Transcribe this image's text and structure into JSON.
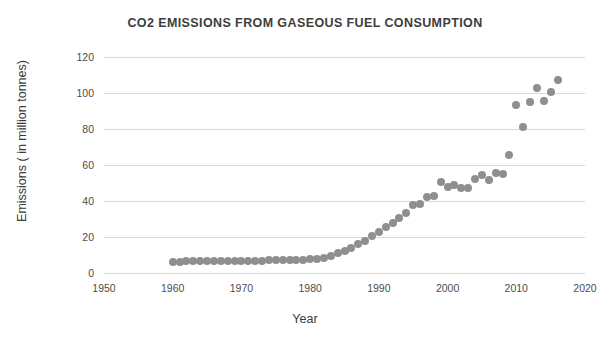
{
  "chart_data": {
    "type": "scatter",
    "title": "CO2 EMISSIONS FROM GASEOUS FUEL CONSUMPTION",
    "xlabel": "Year",
    "ylabel": "Emissions ( in million tonnes)",
    "xlim": [
      1950,
      2020
    ],
    "ylim": [
      0,
      120
    ],
    "xticks": [
      1950,
      1960,
      1970,
      1980,
      1990,
      2000,
      2010,
      2020
    ],
    "yticks": [
      0,
      20,
      40,
      60,
      80,
      100,
      120
    ],
    "grid": "horizontal",
    "legend": "none",
    "marker_color": "#8f8f8f",
    "marker_size": 8,
    "series": [
      {
        "name": "CO2 emissions from gaseous fuel consumption",
        "points": [
          {
            "x": 1960,
            "y": 6.2
          },
          {
            "x": 1961,
            "y": 6.3
          },
          {
            "x": 1962,
            "y": 6.4
          },
          {
            "x": 1963,
            "y": 6.4
          },
          {
            "x": 1964,
            "y": 6.5
          },
          {
            "x": 1965,
            "y": 6.5
          },
          {
            "x": 1966,
            "y": 6.6
          },
          {
            "x": 1967,
            "y": 6.6
          },
          {
            "x": 1968,
            "y": 6.7
          },
          {
            "x": 1969,
            "y": 6.7
          },
          {
            "x": 1970,
            "y": 6.8
          },
          {
            "x": 1971,
            "y": 6.8
          },
          {
            "x": 1972,
            "y": 6.9
          },
          {
            "x": 1973,
            "y": 6.9
          },
          {
            "x": 1974,
            "y": 7.0
          },
          {
            "x": 1975,
            "y": 7.0
          },
          {
            "x": 1976,
            "y": 7.1
          },
          {
            "x": 1977,
            "y": 7.2
          },
          {
            "x": 1978,
            "y": 7.3
          },
          {
            "x": 1979,
            "y": 7.4
          },
          {
            "x": 1980,
            "y": 7.6
          },
          {
            "x": 1981,
            "y": 7.9
          },
          {
            "x": 1982,
            "y": 8.4
          },
          {
            "x": 1983,
            "y": 9.5
          },
          {
            "x": 1984,
            "y": 11.0
          },
          {
            "x": 1985,
            "y": 12.5
          },
          {
            "x": 1986,
            "y": 14.0
          },
          {
            "x": 1987,
            "y": 16.0
          },
          {
            "x": 1988,
            "y": 18.0
          },
          {
            "x": 1989,
            "y": 20.5
          },
          {
            "x": 1990,
            "y": 23.0
          },
          {
            "x": 1991,
            "y": 25.5
          },
          {
            "x": 1992,
            "y": 28.0
          },
          {
            "x": 1993,
            "y": 30.5
          },
          {
            "x": 1994,
            "y": 33.5
          },
          {
            "x": 1995,
            "y": 38.0
          },
          {
            "x": 1996,
            "y": 38.5
          },
          {
            "x": 1997,
            "y": 42.0
          },
          {
            "x": 1998,
            "y": 43.0
          },
          {
            "x": 1999,
            "y": 50.5
          },
          {
            "x": 2000,
            "y": 48.0
          },
          {
            "x": 2001,
            "y": 49.0
          },
          {
            "x": 2002,
            "y": 47.5
          },
          {
            "x": 2003,
            "y": 47.5
          },
          {
            "x": 2004,
            "y": 52.0
          },
          {
            "x": 2005,
            "y": 54.5
          },
          {
            "x": 2006,
            "y": 51.5
          },
          {
            "x": 2007,
            "y": 55.5
          },
          {
            "x": 2008,
            "y": 55.0
          },
          {
            "x": 2009,
            "y": 65.5
          },
          {
            "x": 2010,
            "y": 93.5
          },
          {
            "x": 2011,
            "y": 81.0
          },
          {
            "x": 2012,
            "y": 95.0
          },
          {
            "x": 2013,
            "y": 103.0
          },
          {
            "x": 2014,
            "y": 95.5
          },
          {
            "x": 2015,
            "y": 100.5
          },
          {
            "x": 2016,
            "y": 107.5
          }
        ]
      }
    ]
  }
}
